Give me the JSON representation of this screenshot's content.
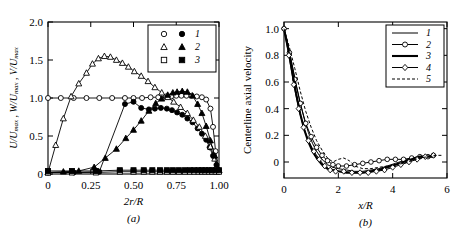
{
  "figure": {
    "panel_a_caption": "(a)",
    "panel_b_caption": "(b)"
  },
  "chart_data": [
    {
      "type": "scatter",
      "panel": "a",
      "title": "",
      "xlabel": "2r/R",
      "ylabel": "U/Umax , W/Umax , V/Umax",
      "ylabel_parts": [
        "U/U",
        "max",
        " , ",
        "W/U",
        "max",
        " , ",
        "V/U",
        "max"
      ],
      "xlim": [
        0,
        1.0
      ],
      "ylim": [
        0,
        2.0
      ],
      "xticks": [
        0,
        0.25,
        0.5,
        0.75,
        1.0
      ],
      "xticklabels": [
        "0",
        "0.25",
        "0.50",
        "0.75",
        "1.00"
      ],
      "yticks": [
        0,
        0.5,
        1.0,
        1.5,
        2.0
      ],
      "yticklabels": [
        "0",
        "0.5",
        "1.0",
        "1.5",
        "2.0"
      ],
      "grid": false,
      "legend_position": "top-right",
      "legend": [
        {
          "label": "1",
          "markers": [
            "open-circle",
            "filled-circle"
          ]
        },
        {
          "label": "2",
          "markers": [
            "open-triangle",
            "filled-triangle"
          ]
        },
        {
          "label": "3",
          "markers": [
            "open-square",
            "filled-square"
          ]
        }
      ],
      "series": [
        {
          "name": "1-open",
          "marker": "open-circle",
          "x": [
            0.0,
            0.075,
            0.15,
            0.225,
            0.3,
            0.375,
            0.45,
            0.5,
            0.55,
            0.6,
            0.645,
            0.69,
            0.72,
            0.75,
            0.78,
            0.81,
            0.84,
            0.87,
            0.9,
            0.925,
            0.95,
            0.965,
            0.98,
            1.0
          ],
          "y": [
            1.0,
            1.0,
            1.0,
            1.0,
            1.0,
            1.0,
            1.0,
            1.0,
            1.0,
            1.01,
            1.01,
            1.02,
            1.02,
            1.03,
            1.03,
            1.03,
            1.03,
            1.02,
            1.01,
            0.98,
            0.86,
            0.62,
            0.3,
            0.03
          ]
        },
        {
          "name": "1-filled",
          "marker": "filled-circle",
          "x": [
            0.0,
            0.15,
            0.3,
            0.45,
            0.5,
            0.545,
            0.59,
            0.625,
            0.66,
            0.695,
            0.725,
            0.755,
            0.785,
            0.815,
            0.845,
            0.875,
            0.9,
            0.925,
            0.945,
            0.965,
            0.985,
            1.0
          ],
          "y": [
            0.02,
            0.02,
            0.03,
            0.92,
            0.95,
            0.87,
            0.85,
            0.86,
            0.87,
            0.86,
            0.84,
            0.81,
            0.78,
            0.73,
            0.68,
            0.6,
            0.53,
            0.45,
            0.35,
            0.24,
            0.12,
            0.03
          ]
        },
        {
          "name": "2-open",
          "marker": "open-triangle",
          "x": [
            0.0,
            0.045,
            0.09,
            0.135,
            0.18,
            0.225,
            0.26,
            0.295,
            0.33,
            0.365,
            0.4,
            0.435,
            0.47,
            0.505,
            0.545,
            0.585,
            0.625,
            0.665,
            0.7,
            0.735,
            0.775,
            0.815,
            0.85,
            0.885,
            0.92,
            0.95,
            0.975,
            1.0
          ],
          "y": [
            0.02,
            0.38,
            0.73,
            1.02,
            1.19,
            1.33,
            1.45,
            1.52,
            1.55,
            1.54,
            1.5,
            1.46,
            1.41,
            1.35,
            1.29,
            1.22,
            1.14,
            1.07,
            1.01,
            0.95,
            0.88,
            0.8,
            0.71,
            0.62,
            0.5,
            0.36,
            0.2,
            0.05
          ]
        },
        {
          "name": "2-filled",
          "marker": "filled-triangle",
          "x": [
            0.0,
            0.09,
            0.18,
            0.27,
            0.335,
            0.4,
            0.455,
            0.5,
            0.545,
            0.59,
            0.63,
            0.665,
            0.7,
            0.73,
            0.755,
            0.785,
            0.815,
            0.845,
            0.875,
            0.9,
            0.925,
            0.95,
            0.975,
            1.0
          ],
          "y": [
            0.02,
            0.03,
            0.04,
            0.09,
            0.21,
            0.33,
            0.47,
            0.58,
            0.7,
            0.83,
            0.93,
            0.99,
            1.04,
            1.07,
            1.08,
            1.09,
            1.08,
            1.03,
            0.92,
            0.8,
            0.63,
            0.44,
            0.24,
            0.05
          ]
        },
        {
          "name": "3-open",
          "marker": "open-square",
          "x": [
            0.0,
            0.14,
            0.28,
            0.42,
            0.5,
            0.56,
            0.61,
            0.655,
            0.695,
            0.73,
            0.765,
            0.8,
            0.83,
            0.855,
            0.88,
            0.9,
            0.92,
            0.94,
            0.96,
            0.98,
            1.0
          ],
          "y": [
            0.02,
            0.02,
            0.02,
            0.03,
            0.03,
            0.03,
            0.03,
            0.03,
            0.03,
            0.03,
            0.03,
            0.03,
            0.03,
            0.03,
            0.03,
            0.03,
            0.03,
            0.03,
            0.03,
            0.03,
            0.03
          ]
        },
        {
          "name": "3-filled",
          "marker": "filled-square",
          "x": [
            0.0,
            0.14,
            0.28,
            0.42,
            0.5,
            0.56,
            0.61,
            0.655,
            0.695,
            0.73,
            0.765,
            0.8,
            0.83,
            0.855,
            0.88,
            0.9,
            0.92,
            0.94,
            0.96,
            0.98,
            1.0
          ],
          "y": [
            0.04,
            0.04,
            0.04,
            0.05,
            0.05,
            0.05,
            0.05,
            0.05,
            0.05,
            0.05,
            0.05,
            0.05,
            0.05,
            0.05,
            0.05,
            0.05,
            0.05,
            0.05,
            0.05,
            0.05,
            0.05
          ]
        }
      ]
    },
    {
      "type": "line",
      "panel": "b",
      "title": "",
      "xlabel": "x/R",
      "ylabel": "Centerline axial velocity",
      "xlim": [
        0,
        6
      ],
      "ylim": [
        -0.12,
        1.05
      ],
      "xticks": [
        0,
        2,
        4,
        6
      ],
      "xticklabels": [
        "0",
        "2",
        "4",
        "6"
      ],
      "yticks": [
        0,
        0.2,
        0.4,
        0.6,
        0.8,
        1.0
      ],
      "yticklabels": [
        "0",
        "0.2",
        "0.4",
        "0.6",
        "0.8",
        "1.0"
      ],
      "grid": false,
      "legend_position": "top-right",
      "legend": [
        {
          "label": "1",
          "style": "thin-solid"
        },
        {
          "label": "2",
          "style": "solid-open-circle"
        },
        {
          "label": "3",
          "style": "thick-solid"
        },
        {
          "label": "4",
          "style": "solid-open-diamond"
        },
        {
          "label": "5",
          "style": "dashed"
        }
      ],
      "series": [
        {
          "name": "1",
          "style": "thin-solid",
          "x": [
            0.0,
            0.15,
            0.3,
            0.45,
            0.6,
            0.75,
            0.9,
            1.05,
            1.2,
            1.4,
            1.6,
            1.8,
            2.0,
            2.3,
            2.6,
            2.9,
            3.2,
            3.5,
            3.8,
            4.1,
            4.4,
            4.7,
            5.0,
            5.3,
            5.5
          ],
          "y": [
            1.0,
            0.88,
            0.73,
            0.58,
            0.44,
            0.32,
            0.22,
            0.14,
            0.08,
            0.02,
            -0.02,
            -0.04,
            -0.05,
            -0.06,
            -0.07,
            -0.07,
            -0.06,
            -0.05,
            -0.03,
            -0.01,
            0.01,
            0.03,
            0.04,
            0.04,
            0.04
          ]
        },
        {
          "name": "2",
          "style": "solid-open-circle",
          "x": [
            0.0,
            0.2,
            0.4,
            0.6,
            0.8,
            1.0,
            1.2,
            1.4,
            1.6,
            1.8,
            2.0,
            2.3,
            2.6,
            2.9,
            3.2,
            3.5,
            3.8,
            4.1,
            4.4,
            4.7,
            5.0,
            5.3,
            5.5
          ],
          "y": [
            1.0,
            0.82,
            0.62,
            0.44,
            0.29,
            0.19,
            0.11,
            0.05,
            0.01,
            -0.02,
            -0.03,
            -0.03,
            -0.02,
            -0.01,
            0.0,
            0.01,
            0.02,
            0.02,
            0.02,
            0.03,
            0.04,
            0.04,
            0.05
          ]
        },
        {
          "name": "3",
          "style": "thick-solid",
          "x": [
            0.0,
            0.15,
            0.3,
            0.45,
            0.6,
            0.75,
            0.9,
            1.05,
            1.2,
            1.4,
            1.6,
            1.8,
            2.0,
            2.3,
            2.6,
            2.9,
            3.2,
            3.5,
            3.8,
            4.1,
            4.4,
            4.7,
            5.0,
            5.3,
            5.5
          ],
          "y": [
            1.0,
            0.85,
            0.68,
            0.51,
            0.36,
            0.24,
            0.15,
            0.08,
            0.03,
            -0.02,
            -0.05,
            -0.06,
            -0.07,
            -0.08,
            -0.08,
            -0.08,
            -0.07,
            -0.06,
            -0.04,
            -0.02,
            0.0,
            0.02,
            0.04,
            0.04,
            0.04
          ]
        },
        {
          "name": "4",
          "style": "solid-open-diamond",
          "x": [
            0.0,
            0.18,
            0.36,
            0.54,
            0.72,
            0.9,
            1.1,
            1.3,
            1.5,
            1.7,
            1.9,
            2.2,
            2.5,
            2.8,
            3.1,
            3.4,
            3.7,
            4.0,
            4.3,
            4.6,
            4.9,
            5.2,
            5.5
          ],
          "y": [
            1.0,
            0.8,
            0.58,
            0.4,
            0.26,
            0.16,
            0.08,
            0.02,
            -0.03,
            -0.06,
            -0.07,
            -0.07,
            -0.08,
            -0.08,
            -0.08,
            -0.07,
            -0.06,
            -0.04,
            -0.02,
            0.0,
            0.02,
            0.04,
            0.05
          ]
        },
        {
          "name": "5",
          "style": "dashed",
          "x": [
            0.0,
            0.2,
            0.4,
            0.6,
            0.8,
            1.0,
            1.2,
            1.4,
            1.6,
            1.8,
            2.0,
            2.2,
            2.4,
            2.6,
            2.9,
            3.2,
            3.5,
            3.8,
            4.1,
            4.4,
            4.7,
            5.0,
            5.3,
            5.6,
            5.85
          ],
          "y": [
            1.0,
            0.86,
            0.7,
            0.53,
            0.38,
            0.26,
            0.16,
            0.09,
            0.03,
            0.0,
            0.02,
            0.03,
            0.01,
            -0.03,
            -0.05,
            -0.05,
            -0.04,
            -0.03,
            -0.02,
            -0.01,
            0.01,
            0.03,
            0.04,
            0.05,
            0.05
          ]
        }
      ]
    }
  ]
}
